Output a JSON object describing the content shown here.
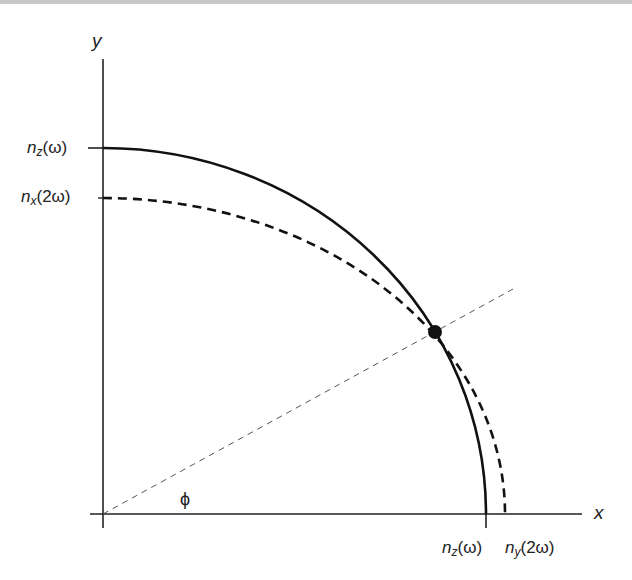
{
  "diagram": {
    "axes": {
      "x_label": "x",
      "y_label": "y"
    },
    "curves": [
      {
        "name": "n_z(omega)",
        "style": "solid",
        "color": "#111111"
      },
      {
        "name": "n_x/n_y(2omega)",
        "style": "dashed",
        "color": "#111111"
      }
    ],
    "y_ticks": [
      {
        "base": "n",
        "sub": "z",
        "arg": "(ω)"
      },
      {
        "base": "n",
        "sub": "x",
        "arg": "(2ω)"
      }
    ],
    "x_ticks": [
      {
        "base": "n",
        "sub": "z",
        "arg": "(ω)"
      },
      {
        "base": "n",
        "sub": "y",
        "arg": "(2ω)"
      }
    ],
    "angle_label": "ϕ",
    "intersection_point": "phase-matching point"
  }
}
